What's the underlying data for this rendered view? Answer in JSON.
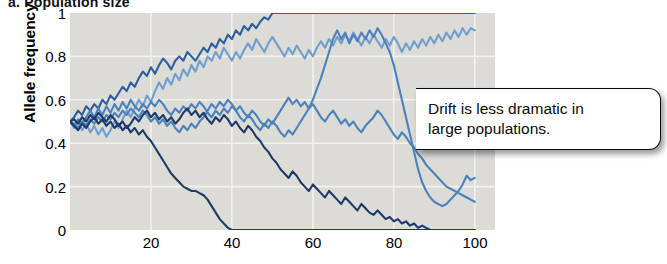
{
  "panel": {
    "label": "a. Population size"
  },
  "axes": {
    "ylabel": "Allele frequency",
    "xlabel": "",
    "yticks": [
      "1",
      "0.8",
      "0.6",
      "0.4",
      "0.2",
      "0"
    ],
    "xticks": [
      "20",
      "40",
      "60",
      "80",
      "100"
    ]
  },
  "callout": {
    "line1": "Drift is less dramatic in",
    "line2": "large populations.",
    "text": "Drift is less dramatic in large populations."
  },
  "colors": {
    "plot_background": "#dddbd6",
    "gridline": "#f2f1ee",
    "series_navy": "#1d3a69",
    "series_dark_blue": "#2f5f9e",
    "series_medium_blue": "#4a82bd",
    "series_steel_blue": "#6f9fd0",
    "series_light_blue": "#9cc0e0",
    "callout_border": "#0d0d0d",
    "text": "#000000"
  },
  "chart_data": {
    "type": "line",
    "title": "a. Population size",
    "xlabel": "",
    "ylabel": "Allele frequency",
    "xlim": [
      0,
      105
    ],
    "ylim": [
      0,
      1
    ],
    "grid": true,
    "legend": "none",
    "annotations": [
      {
        "text": "Drift is less dramatic in large populations.",
        "x": 78,
        "y": 0.46
      }
    ],
    "x": [
      0,
      1,
      2,
      3,
      4,
      5,
      6,
      7,
      8,
      9,
      10,
      11,
      12,
      13,
      14,
      15,
      16,
      17,
      18,
      19,
      20,
      21,
      22,
      23,
      24,
      25,
      26,
      27,
      28,
      29,
      30,
      31,
      32,
      33,
      34,
      35,
      36,
      37,
      38,
      39,
      40,
      41,
      42,
      43,
      44,
      45,
      46,
      47,
      48,
      49,
      50,
      51,
      52,
      53,
      54,
      55,
      56,
      57,
      58,
      59,
      60,
      61,
      62,
      63,
      64,
      65,
      66,
      67,
      68,
      69,
      70,
      71,
      72,
      73,
      74,
      75,
      76,
      77,
      78,
      79,
      80,
      81,
      82,
      83,
      84,
      85,
      86,
      87,
      88,
      89,
      90,
      91,
      92,
      93,
      94,
      95,
      96,
      97,
      98,
      99,
      100
    ],
    "series": [
      {
        "name": "population-1-fixed-at-1",
        "color": "#2f5f9e",
        "values": [
          0.5,
          0.52,
          0.55,
          0.53,
          0.57,
          0.55,
          0.58,
          0.56,
          0.6,
          0.58,
          0.62,
          0.6,
          0.63,
          0.66,
          0.64,
          0.68,
          0.66,
          0.7,
          0.73,
          0.71,
          0.75,
          0.72,
          0.76,
          0.79,
          0.77,
          0.74,
          0.78,
          0.8,
          0.78,
          0.82,
          0.8,
          0.78,
          0.81,
          0.84,
          0.82,
          0.86,
          0.84,
          0.88,
          0.86,
          0.9,
          0.88,
          0.92,
          0.9,
          0.94,
          0.92,
          0.95,
          0.93,
          0.96,
          0.98,
          0.97,
          1.0,
          1.0,
          1.0,
          1.0,
          1.0,
          1.0,
          1.0,
          1.0,
          1.0,
          1.0,
          1.0,
          1.0,
          1.0,
          1.0,
          1.0,
          1.0,
          1.0,
          1.0,
          1.0,
          1.0,
          1.0,
          1.0,
          1.0,
          1.0,
          1.0,
          1.0,
          1.0,
          1.0,
          1.0,
          1.0,
          1.0,
          1.0,
          1.0,
          1.0,
          1.0,
          1.0,
          1.0,
          1.0,
          1.0,
          1.0,
          1.0,
          1.0,
          1.0,
          1.0,
          1.0,
          1.0,
          1.0,
          1.0,
          1.0,
          1.0,
          1.0
        ]
      },
      {
        "name": "population-2-high-wandering",
        "color": "#6f9fd0",
        "values": [
          0.5,
          0.47,
          0.5,
          0.46,
          0.49,
          0.45,
          0.48,
          0.44,
          0.47,
          0.43,
          0.46,
          0.5,
          0.47,
          0.51,
          0.55,
          0.52,
          0.56,
          0.6,
          0.57,
          0.62,
          0.59,
          0.64,
          0.68,
          0.65,
          0.7,
          0.67,
          0.72,
          0.69,
          0.74,
          0.71,
          0.76,
          0.73,
          0.78,
          0.75,
          0.8,
          0.78,
          0.82,
          0.79,
          0.84,
          0.81,
          0.78,
          0.82,
          0.79,
          0.83,
          0.86,
          0.83,
          0.88,
          0.85,
          0.82,
          0.86,
          0.89,
          0.86,
          0.83,
          0.8,
          0.84,
          0.81,
          0.85,
          0.82,
          0.79,
          0.83,
          0.8,
          0.84,
          0.87,
          0.84,
          0.88,
          0.85,
          0.89,
          0.86,
          0.9,
          0.87,
          0.91,
          0.88,
          0.85,
          0.89,
          0.86,
          0.9,
          0.87,
          0.84,
          0.88,
          0.85,
          0.89,
          0.86,
          0.82,
          0.86,
          0.83,
          0.87,
          0.84,
          0.88,
          0.85,
          0.89,
          0.86,
          0.9,
          0.87,
          0.91,
          0.88,
          0.92,
          0.89,
          0.93,
          0.9,
          0.93,
          0.92
        ]
      },
      {
        "name": "population-3-late-rise",
        "color": "#4a82bd",
        "values": [
          0.5,
          0.48,
          0.51,
          0.49,
          0.52,
          0.55,
          0.52,
          0.56,
          0.53,
          0.57,
          0.54,
          0.58,
          0.55,
          0.59,
          0.56,
          0.6,
          0.57,
          0.55,
          0.58,
          0.56,
          0.59,
          0.57,
          0.6,
          0.58,
          0.55,
          0.53,
          0.56,
          0.54,
          0.57,
          0.55,
          0.58,
          0.56,
          0.59,
          0.57,
          0.54,
          0.52,
          0.55,
          0.53,
          0.56,
          0.54,
          0.57,
          0.55,
          0.52,
          0.5,
          0.53,
          0.51,
          0.48,
          0.46,
          0.49,
          0.47,
          0.5,
          0.48,
          0.45,
          0.43,
          0.46,
          0.44,
          0.47,
          0.5,
          0.53,
          0.56,
          0.6,
          0.65,
          0.7,
          0.76,
          0.82,
          0.88,
          0.92,
          0.88,
          0.91,
          0.86,
          0.9,
          0.87,
          0.91,
          0.88,
          0.92,
          0.89,
          0.93,
          0.9,
          0.86,
          0.82,
          0.76,
          0.68,
          0.6,
          0.52,
          0.44,
          0.36,
          0.28,
          0.22,
          0.18,
          0.15,
          0.13,
          0.12,
          0.11,
          0.12,
          0.14,
          0.16,
          0.18,
          0.21,
          0.25,
          0.23,
          0.24
        ]
      },
      {
        "name": "population-4-mid-band",
        "color": "#4a82bd",
        "values": [
          0.5,
          0.49,
          0.47,
          0.5,
          0.48,
          0.51,
          0.49,
          0.52,
          0.5,
          0.53,
          0.51,
          0.54,
          0.52,
          0.55,
          0.53,
          0.56,
          0.54,
          0.52,
          0.55,
          0.53,
          0.5,
          0.52,
          0.49,
          0.51,
          0.48,
          0.5,
          0.47,
          0.45,
          0.48,
          0.46,
          0.49,
          0.47,
          0.5,
          0.52,
          0.55,
          0.58,
          0.56,
          0.59,
          0.57,
          0.6,
          0.58,
          0.55,
          0.57,
          0.54,
          0.52,
          0.55,
          0.53,
          0.5,
          0.48,
          0.51,
          0.49,
          0.52,
          0.55,
          0.58,
          0.61,
          0.58,
          0.6,
          0.57,
          0.59,
          0.56,
          0.58,
          0.55,
          0.52,
          0.5,
          0.53,
          0.55,
          0.52,
          0.49,
          0.51,
          0.48,
          0.5,
          0.47,
          0.45,
          0.48,
          0.5,
          0.52,
          0.55,
          0.53,
          0.5,
          0.47,
          0.44,
          0.42,
          0.45,
          0.43,
          0.4,
          0.38,
          0.35,
          0.33,
          0.3,
          0.28,
          0.26,
          0.24,
          0.22,
          0.2,
          0.19,
          0.18,
          0.17,
          0.16,
          0.15,
          0.14,
          0.13
        ]
      },
      {
        "name": "population-5-lost-at-zero",
        "color": "#1d3a69",
        "values": [
          0.5,
          0.48,
          0.46,
          0.49,
          0.47,
          0.5,
          0.52,
          0.49,
          0.51,
          0.48,
          0.5,
          0.47,
          0.49,
          0.46,
          0.48,
          0.45,
          0.47,
          0.44,
          0.46,
          0.43,
          0.41,
          0.38,
          0.35,
          0.32,
          0.29,
          0.26,
          0.24,
          0.22,
          0.2,
          0.19,
          0.18,
          0.18,
          0.17,
          0.16,
          0.14,
          0.11,
          0.08,
          0.05,
          0.03,
          0.01,
          0.0,
          0.0,
          0.0,
          0.0,
          0.0,
          0.0,
          0.0,
          0.0,
          0.0,
          0.0,
          0.0,
          0.0,
          0.0,
          0.0,
          0.0,
          0.0,
          0.0,
          0.0,
          0.0,
          0.0,
          0.0,
          0.0,
          0.0,
          0.0,
          0.0,
          0.0,
          0.0,
          0.0,
          0.0,
          0.0,
          0.0,
          0.0,
          0.0,
          0.0,
          0.0,
          0.0,
          0.0,
          0.0,
          0.0,
          0.0,
          0.0,
          0.0,
          0.0,
          0.0,
          0.0,
          0.0,
          0.0,
          0.0,
          0.0,
          0.0,
          0.0,
          0.0,
          0.0,
          0.0,
          0.0,
          0.0,
          0.0,
          0.0,
          0.0,
          0.0,
          0.0
        ]
      },
      {
        "name": "population-6-declining-navy",
        "color": "#1d3a69",
        "values": [
          0.5,
          0.51,
          0.49,
          0.52,
          0.5,
          0.53,
          0.51,
          0.54,
          0.52,
          0.5,
          0.53,
          0.51,
          0.48,
          0.5,
          0.47,
          0.49,
          0.52,
          0.5,
          0.53,
          0.55,
          0.52,
          0.54,
          0.51,
          0.53,
          0.5,
          0.52,
          0.49,
          0.51,
          0.54,
          0.56,
          0.53,
          0.55,
          0.52,
          0.54,
          0.51,
          0.49,
          0.52,
          0.5,
          0.53,
          0.51,
          0.48,
          0.5,
          0.47,
          0.45,
          0.48,
          0.46,
          0.43,
          0.41,
          0.38,
          0.36,
          0.33,
          0.31,
          0.28,
          0.26,
          0.24,
          0.27,
          0.25,
          0.22,
          0.2,
          0.18,
          0.21,
          0.19,
          0.17,
          0.15,
          0.18,
          0.16,
          0.14,
          0.12,
          0.15,
          0.13,
          0.11,
          0.09,
          0.12,
          0.1,
          0.08,
          0.07,
          0.09,
          0.07,
          0.05,
          0.06,
          0.04,
          0.05,
          0.03,
          0.04,
          0.02,
          0.03,
          0.01,
          0.02,
          0.01,
          0.0,
          0.0,
          0.0,
          0.0,
          0.0,
          0.0,
          0.0,
          0.0,
          0.0,
          0.0,
          0.0,
          0.0
        ]
      }
    ]
  }
}
